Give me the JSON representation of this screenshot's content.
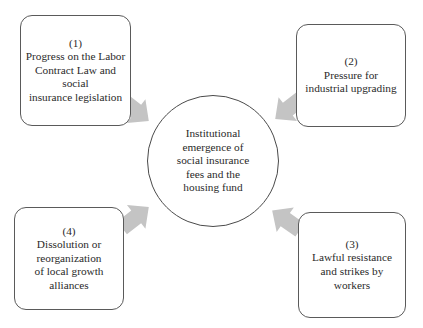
{
  "diagram": {
    "center": {
      "lines": [
        "Institutional",
        "emergence of",
        "social insurance",
        "fees and the",
        "housing fund"
      ]
    },
    "factors": [
      {
        "number": "(1)",
        "lines": [
          "Progress on the Labor",
          "Contract Law and social",
          "insurance legislation"
        ]
      },
      {
        "number": "(2)",
        "lines": [
          "Pressure for",
          "industrial upgrading"
        ]
      },
      {
        "number": "(3)",
        "lines": [
          "Lawful resistance",
          "and strikes by",
          "workers"
        ]
      },
      {
        "number": "(4)",
        "lines": [
          "Dissolution or",
          "reorganization",
          "of local growth",
          "alliances"
        ]
      }
    ],
    "colors": {
      "arrow": "#c4c4c4",
      "border": "#555555",
      "text": "#2a2a2a"
    }
  }
}
